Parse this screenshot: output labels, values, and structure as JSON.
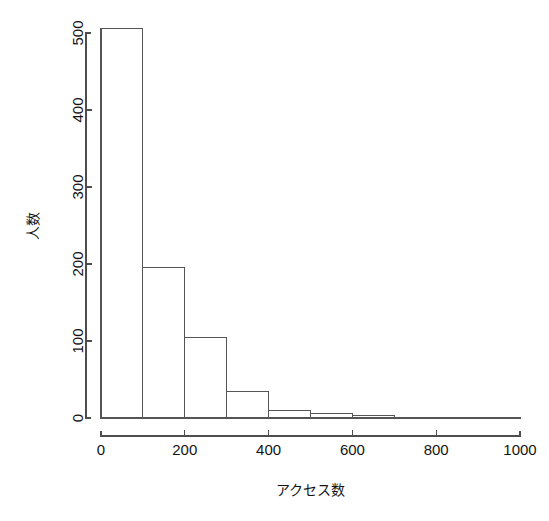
{
  "chart_data": {
    "type": "bar",
    "title": "",
    "subtitle": "",
    "xlabel": "アクセス数",
    "ylabel": "人数",
    "categories": [
      "0-100",
      "100-200",
      "200-300",
      "300-400",
      "400-500",
      "500-600",
      "600-700",
      "700-800",
      "800-900",
      "900-1000"
    ],
    "bin_edges": [
      0,
      100,
      200,
      300,
      400,
      500,
      600,
      700,
      800,
      900,
      1000
    ],
    "values": [
      506,
      196,
      104,
      34,
      10,
      6,
      3,
      1,
      1,
      1
    ],
    "xlim": [
      0,
      1000
    ],
    "ylim": [
      0,
      506
    ],
    "xticks": [
      0,
      200,
      400,
      600,
      800,
      1000
    ],
    "xtick_labels": [
      "0",
      "200",
      "400",
      "600",
      "800",
      "1000"
    ],
    "yticks": [
      0,
      100,
      200,
      300,
      400,
      500
    ],
    "ytick_labels": [
      "0",
      "100",
      "200",
      "300",
      "400",
      "500"
    ],
    "grid": false,
    "legend": null,
    "legend_position": "none",
    "bar_fill": "#ffffff",
    "bar_stroke": "#555555",
    "axis_color": "#4d4d4d",
    "background": "#ffffff",
    "ytick_label_rotation": -90,
    "ylabel_rotation": -90
  }
}
